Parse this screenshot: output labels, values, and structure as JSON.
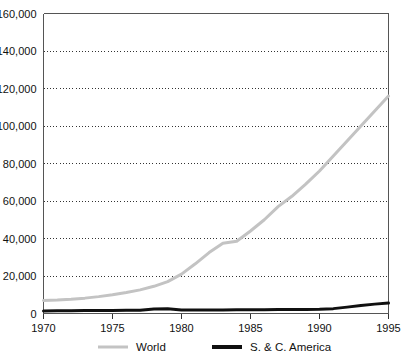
{
  "chart_data": {
    "type": "line",
    "title": "",
    "subtitle": "",
    "xlabel": "",
    "ylabel": "",
    "xlim": [
      1970,
      1995
    ],
    "ylim": [
      0,
      160000
    ],
    "grid": true,
    "grid_axis": "y",
    "legend_position": "bottom",
    "x": [
      1970,
      1971,
      1972,
      1973,
      1974,
      1975,
      1976,
      1977,
      1978,
      1979,
      1980,
      1981,
      1982,
      1983,
      1984,
      1985,
      1986,
      1987,
      1988,
      1989,
      1990,
      1991,
      1992,
      1993,
      1994,
      1995
    ],
    "xticks": [
      1970,
      1975,
      1980,
      1985,
      1990,
      1995
    ],
    "xticklabels": [
      "1970",
      "1975",
      "1980",
      "1985",
      "1990",
      "1995"
    ],
    "yticks": [
      0,
      20000,
      40000,
      60000,
      80000,
      100000,
      120000,
      140000,
      160000
    ],
    "yticklabels": [
      "0",
      "20,000",
      "40,000",
      "60,000",
      "80,000",
      "100,000",
      "120,000",
      "140,000",
      "160,000"
    ],
    "series": [
      {
        "name": "World",
        "color": "#c3c3c3",
        "linewidth": 3,
        "values": [
          7000,
          7200,
          7600,
          8200,
          9000,
          10000,
          11200,
          12600,
          14500,
          17000,
          21000,
          26500,
          32500,
          37500,
          38500,
          44000,
          50000,
          57000,
          62500,
          69000,
          76000,
          84000,
          92000,
          100000,
          108000,
          116000
        ]
      },
      {
        "name": "S. & C. America",
        "color": "#101010",
        "linewidth": 3,
        "values": [
          1400,
          1450,
          1500,
          1550,
          1600,
          1650,
          1700,
          1800,
          2400,
          2500,
          1900,
          1850,
          1850,
          1900,
          1950,
          2000,
          2050,
          2100,
          2150,
          2200,
          2300,
          2600,
          3400,
          4300,
          5000,
          5600
        ]
      }
    ],
    "series_world_actual": {
      "note": "World curve sampled at tick years",
      "1970": 7000,
      "1975": 10000,
      "1980": 21000,
      "1982": 37000,
      "1983": 38000,
      "1985": 60000,
      "1990": 100000,
      "1995": 140000
    },
    "legend": [
      {
        "label": "World",
        "color": "#c3c3c3",
        "linewidth": 3
      },
      {
        "label": "S. & C. America",
        "color": "#101010",
        "linewidth": 4
      }
    ]
  }
}
